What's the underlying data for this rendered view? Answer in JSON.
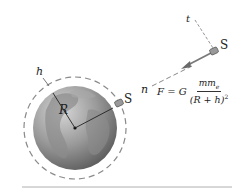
{
  "diagram": {
    "labels": {
      "altitude": "h",
      "radius": "R",
      "satellite_near": "S",
      "satellite_far": "S",
      "tangential_axis": "t",
      "normal_axis": "n"
    },
    "formula": {
      "lhs": "F",
      "equals": " = ",
      "constant": "G",
      "numerator_m": "mm",
      "numerator_sub": "e",
      "denominator_text": "(R + h)",
      "denominator_exp": "2"
    },
    "colors": {
      "earth_light": "#c9c9c9",
      "earth_dark": "#6e6e6e",
      "orbit_dash": "#8a8a8a",
      "force_arrow": "#7a7a7a",
      "baseline": "#b0b0b0",
      "text": "#222222"
    }
  }
}
